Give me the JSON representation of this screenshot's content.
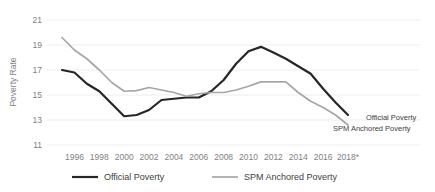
{
  "chart_data": {
    "type": "line",
    "title": "",
    "xlabel": "",
    "ylabel": "Poverty Rate",
    "ylim": [
      11,
      21
    ],
    "yticks": [
      11,
      13,
      15,
      17,
      19,
      21
    ],
    "ytick_labels": [
      "11",
      "13",
      "15",
      "17",
      "19",
      "21"
    ],
    "xlim": [
      1995,
      2018
    ],
    "xticks": [
      1996,
      1998,
      2000,
      2002,
      2004,
      2006,
      2008,
      2010,
      2012,
      2014,
      2016,
      2018
    ],
    "xtick_labels": [
      "1996",
      "1998",
      "2000",
      "2002",
      "2004",
      "2006",
      "2008",
      "2010",
      "2012",
      "2014",
      "2016",
      "2018*"
    ],
    "grid": true,
    "grid_axis": "y",
    "legend_position": "bottom",
    "x": [
      1995,
      1996,
      1997,
      1998,
      1999,
      2000,
      2001,
      2002,
      2003,
      2004,
      2005,
      2006,
      2007,
      2008,
      2009,
      2010,
      2011,
      2012,
      2013,
      2014,
      2015,
      2016,
      2017,
      2018
    ],
    "series": [
      {
        "name": "Official Poverty",
        "color": "#262626",
        "end_label": "Official Poverty",
        "values": [
          17.0,
          16.8,
          15.9,
          15.3,
          14.3,
          13.3,
          13.4,
          13.8,
          14.6,
          14.7,
          14.8,
          14.8,
          15.3,
          16.2,
          17.5,
          18.5,
          18.85,
          18.4,
          17.9,
          17.3,
          16.7,
          15.5,
          14.4,
          13.4
        ]
      },
      {
        "name": "SPM Anchored Poverty",
        "color": "#a6a6a6",
        "end_label": "SPM Anchored Poverty",
        "values": [
          19.6,
          18.6,
          17.9,
          17.0,
          16.0,
          15.3,
          15.35,
          15.6,
          15.4,
          15.2,
          14.9,
          15.1,
          15.2,
          15.2,
          15.4,
          15.7,
          16.05,
          16.05,
          16.05,
          15.2,
          14.5,
          14.0,
          13.4,
          12.6
        ]
      }
    ]
  },
  "legend": {
    "items": [
      {
        "label": "Official Poverty",
        "color": "#262626"
      },
      {
        "label": "SPM Anchored Poverty",
        "color": "#a6a6a6"
      }
    ]
  }
}
